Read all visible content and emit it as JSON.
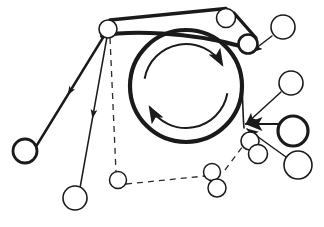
{
  "figure": {
    "title": "",
    "type": "mechanical-belt-pulley-schematic",
    "canvas": {
      "width": 324,
      "height": 227
    },
    "background_color": "#ffffff",
    "stroke_color": "#1a1a1a",
    "line_color_light": "#3a3a3a"
  },
  "drum": {
    "name": "main-drum",
    "cx": 186,
    "cy": 86,
    "r": 56,
    "stroke_width": 4.2,
    "rotation_arrows": [
      {
        "name": "upper-rotation-arrow",
        "direction": "clockwise",
        "arc_r": 42,
        "start_deg": 190,
        "end_deg": 330
      },
      {
        "name": "lower-rotation-arrow",
        "direction": "clockwise",
        "arc_r": 42,
        "start_deg": 10,
        "end_deg": 150
      }
    ]
  },
  "pulleys": [
    {
      "name": "pulley-top-left",
      "cx": 108,
      "cy": 29,
      "r": 9,
      "stroke_width": 1.6,
      "style": "thin"
    },
    {
      "name": "pulley-top-right-upper",
      "cx": 226,
      "cy": 18,
      "r": 9.5,
      "stroke_width": 1.6,
      "style": "thin"
    },
    {
      "name": "pulley-top-right-lower",
      "cx": 248,
      "cy": 44,
      "r": 9.5,
      "stroke_width": 2.6,
      "style": "medium"
    },
    {
      "name": "roller-upper-right",
      "cx": 283,
      "cy": 27,
      "r": 12,
      "stroke_width": 1.6,
      "style": "thin"
    },
    {
      "name": "roller-mid-right",
      "cx": 291,
      "cy": 83,
      "r": 12,
      "stroke_width": 1.6,
      "style": "thin"
    },
    {
      "name": "roller-right-thick",
      "cx": 293,
      "cy": 131,
      "r": 15,
      "stroke_width": 3.2,
      "style": "thick"
    },
    {
      "name": "roller-lower-right",
      "cx": 298,
      "cy": 165,
      "r": 14,
      "stroke_width": 1.6,
      "style": "thin"
    },
    {
      "name": "pulley-cluster-a",
      "cx": 250,
      "cy": 141,
      "r": 9,
      "stroke_width": 1.6,
      "style": "thin"
    },
    {
      "name": "pulley-cluster-b",
      "cx": 258,
      "cy": 154,
      "r": 9.5,
      "stroke_width": 1.6,
      "style": "thin"
    },
    {
      "name": "pulley-bottom-mid-a",
      "cx": 212,
      "cy": 172,
      "r": 8.5,
      "stroke_width": 1.5,
      "style": "thin"
    },
    {
      "name": "pulley-bottom-mid-b",
      "cx": 217,
      "cy": 188,
      "r": 9,
      "stroke_width": 1.5,
      "style": "thin"
    },
    {
      "name": "pulley-bottom-left",
      "cx": 118,
      "cy": 180,
      "r": 8.5,
      "stroke_width": 1.5,
      "style": "thin"
    },
    {
      "name": "roller-far-left",
      "cx": 25,
      "cy": 151,
      "r": 12,
      "stroke_width": 2.8,
      "style": "thick"
    },
    {
      "name": "roller-bottom-left",
      "cx": 75,
      "cy": 198,
      "r": 12,
      "stroke_width": 1.6,
      "style": "thin"
    }
  ],
  "belts": [
    {
      "name": "belt-top-span",
      "path": "M 110 20 L 226 8.5",
      "stroke_width": 3.4
    },
    {
      "name": "belt-top-right-outer",
      "path": "M 234 13 L 256 38",
      "stroke_width": 3.4
    },
    {
      "name": "belt-drum-tangent-top",
      "path": "M 102 36 C 128 30 190 32 240 46",
      "stroke_width": 4.0
    },
    {
      "name": "belt-drum-right-lower",
      "path": "M 242 86 C 243 105 243 118 244 128",
      "stroke_width": 1.6
    }
  ],
  "leaders": [
    {
      "name": "leader-to-far-left-roller",
      "path": "M 104 36 L 37 145",
      "arrow": "mid",
      "stroke_width": 2.4
    },
    {
      "name": "leader-to-bottom-left-roller",
      "path": "M 107 37 L 80 188",
      "arrow": "mid",
      "stroke_width": 1.5
    },
    {
      "name": "leader-to-upper-right-roller",
      "path": "M 272 36 L 251 52",
      "arrow": "end",
      "stroke_width": 1.5
    },
    {
      "name": "leader-to-mid-right-roller",
      "path": "M 281 92 L 246 124",
      "arrow": "end",
      "stroke_width": 1.5
    },
    {
      "name": "leader-to-thick-roller",
      "path": "M 278 124 L 246 124",
      "arrow": "end",
      "stroke_width": 2.2
    },
    {
      "name": "leader-to-lower-right-roller",
      "path": "M 286 157 L 247 129",
      "arrow": "end",
      "stroke_width": 1.5
    }
  ],
  "dashed_paths": [
    {
      "name": "dashed-vertical-left",
      "path": "M 110 38 L 116 172",
      "dash": "6 5"
    },
    {
      "name": "dashed-bottom-span",
      "path": "M 126 184 L 205 176",
      "dash": "6 5"
    },
    {
      "name": "dashed-cluster-link",
      "path": "M 225 170 L 243 146",
      "dash": "6 5"
    }
  ],
  "legend": {
    "solid_label": "",
    "dashed_label": "",
    "notes": ""
  }
}
